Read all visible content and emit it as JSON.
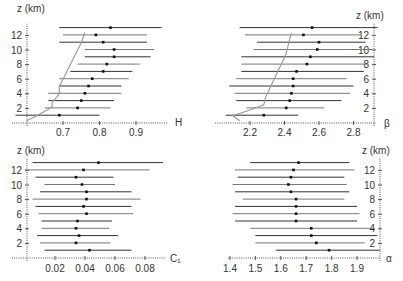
{
  "chart_data": [
    {
      "type": "scatter",
      "subtype": "errorbar-profile",
      "panel": "top-left",
      "xlabel": "H",
      "ylabel": "z (km)",
      "xticks": [
        0.7,
        0.8,
        0.9
      ],
      "yticks": [
        2,
        4,
        6,
        8,
        10,
        12
      ],
      "xlim": [
        0.59,
        0.99
      ],
      "ylim": [
        0,
        13
      ],
      "z": [
        1,
        2,
        3,
        4,
        5,
        6,
        7,
        8,
        9,
        10,
        11,
        12,
        13
      ],
      "mean": [
        0.69,
        0.74,
        0.75,
        0.76,
        0.77,
        0.78,
        0.81,
        0.82,
        0.84,
        0.84,
        0.81,
        0.79,
        0.83
      ],
      "low": [
        0.57,
        0.65,
        0.66,
        0.66,
        0.69,
        0.69,
        0.72,
        0.74,
        0.76,
        0.76,
        0.69,
        0.7,
        0.69
      ],
      "high": [
        0.8,
        0.83,
        0.84,
        0.86,
        0.86,
        0.88,
        0.89,
        0.91,
        0.94,
        0.95,
        0.93,
        0.93,
        0.97
      ],
      "curve": {
        "x": [
          0.6,
          0.62,
          0.65,
          0.67,
          0.67,
          0.69,
          0.69,
          0.7,
          0.71,
          0.72,
          0.73,
          0.74,
          0.75,
          0.76
        ],
        "z": [
          0.3,
          0.8,
          1.6,
          2.2,
          2.8,
          4,
          5,
          6,
          7,
          8,
          9,
          10,
          11,
          12.4
        ]
      },
      "axis_side": "left"
    },
    {
      "type": "scatter",
      "subtype": "errorbar-profile",
      "panel": "top-right",
      "xlabel": "β",
      "ylabel": "z (km)",
      "xticks": [
        2.2,
        2.4,
        2.6,
        2.8
      ],
      "yticks": [
        2,
        4,
        6,
        8,
        10,
        12
      ],
      "xlim": [
        2.07,
        2.95
      ],
      "ylim": [
        0,
        13
      ],
      "z": [
        1,
        2,
        3,
        4,
        5,
        6,
        7,
        8,
        9,
        10,
        11,
        12,
        13
      ],
      "mean": [
        2.28,
        2.41,
        2.43,
        2.44,
        2.45,
        2.45,
        2.47,
        2.53,
        2.55,
        2.59,
        2.6,
        2.51,
        2.56
      ],
      "low": [
        2.06,
        2.18,
        2.12,
        2.11,
        2.08,
        2.12,
        2.15,
        2.15,
        2.15,
        2.22,
        2.24,
        2.17,
        2.14
      ],
      "high": [
        2.48,
        2.63,
        2.73,
        2.78,
        2.8,
        2.76,
        2.86,
        2.88,
        2.92,
        2.91,
        2.87,
        2.84,
        2.94
      ],
      "curve": {
        "x": [
          2.14,
          2.1,
          2.2,
          2.28,
          2.29,
          2.31,
          2.33,
          2.35,
          2.37,
          2.39,
          2.41,
          2.42,
          2.43,
          2.44
        ],
        "z": [
          0.3,
          1.0,
          1.8,
          2.5,
          3.5,
          4.5,
          5.5,
          6.5,
          7.5,
          8.5,
          9.5,
          10.5,
          11.5,
          12.3
        ]
      },
      "axis_side": "right"
    },
    {
      "type": "scatter",
      "subtype": "errorbar-profile",
      "panel": "bottom-left",
      "xlabel": "C₁",
      "ylabel": "z (km)",
      "xticks": [
        0.02,
        0.04,
        0.06,
        0.08
      ],
      "yticks": [
        2,
        4,
        6,
        8,
        10,
        12
      ],
      "xlim": [
        -0.002,
        0.1
      ],
      "ylim": [
        0,
        13
      ],
      "z": [
        1,
        2,
        3,
        4,
        5,
        6,
        7,
        8,
        9,
        10,
        11,
        12,
        13
      ],
      "mean": [
        0.043,
        0.034,
        0.036,
        0.034,
        0.035,
        0.041,
        0.039,
        0.041,
        0.041,
        0.038,
        0.034,
        0.039,
        0.049
      ],
      "low": [
        0.013,
        0.01,
        0.008,
        0.011,
        0.011,
        0.009,
        0.007,
        0.005,
        0.01,
        0.013,
        0.007,
        0.0,
        0.005
      ],
      "high": [
        0.071,
        0.057,
        0.062,
        0.056,
        0.058,
        0.072,
        0.071,
        0.077,
        0.071,
        0.06,
        0.059,
        0.083,
        0.092
      ],
      "axis_side": "left"
    },
    {
      "type": "scatter",
      "subtype": "errorbar-profile",
      "panel": "bottom-right",
      "xlabel": "α",
      "ylabel": "z (km)",
      "xticks": [
        1.4,
        1.5,
        1.6,
        1.7,
        1.8,
        1.9
      ],
      "yticks": [
        2,
        4,
        6,
        8,
        10,
        12
      ],
      "xlim": [
        1.38,
        2.0
      ],
      "ylim": [
        0,
        13
      ],
      "z": [
        1,
        2,
        3,
        4,
        5,
        6,
        7,
        8,
        9,
        10,
        11,
        12,
        13
      ],
      "mean": [
        1.79,
        1.74,
        1.72,
        1.72,
        1.66,
        1.66,
        1.66,
        1.66,
        1.64,
        1.63,
        1.64,
        1.65,
        1.67
      ],
      "low": [
        1.58,
        1.5,
        1.5,
        1.48,
        1.42,
        1.41,
        1.42,
        1.45,
        1.42,
        1.41,
        1.43,
        1.42,
        1.48
      ],
      "high": [
        1.99,
        1.93,
        1.98,
        1.97,
        1.9,
        1.91,
        1.9,
        1.85,
        1.87,
        1.86,
        1.85,
        1.89,
        1.87
      ],
      "axis_side": "right"
    }
  ],
  "labels": {
    "z_axis": "z (km)"
  },
  "colors": {
    "bar": "#333333",
    "bar_light": "#777777",
    "dot": "#111111",
    "curve": "#999999",
    "axis": "#555555"
  }
}
